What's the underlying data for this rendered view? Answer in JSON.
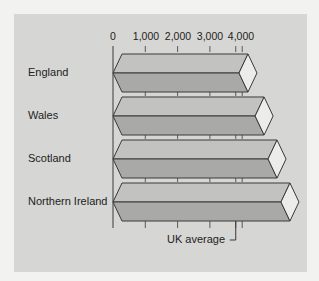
{
  "chart_data": {
    "type": "bar",
    "orientation": "horizontal",
    "style": "3d-prism",
    "title": "",
    "xlabel": "",
    "ylabel": "",
    "categories": [
      "England",
      "Wales",
      "Scotland",
      "Northern Ireland"
    ],
    "values": [
      3900,
      4400,
      4800,
      5200
    ],
    "x_ticks": [
      "0",
      "1,000",
      "2,000",
      "3,000",
      "4,000"
    ],
    "xlim": [
      0,
      5300
    ],
    "grid": false,
    "reference_line": {
      "label": "UK average",
      "value": 3800
    },
    "colors": {
      "bar_top": "#c2c2c0",
      "bar_bottom": "#a9a9a7",
      "bar_end": "#ececea",
      "outline": "#3a3a3a",
      "panel": "#d6d6d4"
    }
  },
  "labels": {
    "ticks": [
      "0",
      "1,000",
      "2,000",
      "3,000",
      "4,000"
    ],
    "rows": [
      "England",
      "Wales",
      "Scotland",
      "Northern Ireland"
    ],
    "uk_average": "UK average"
  }
}
